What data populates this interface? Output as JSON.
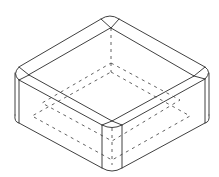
{
  "figure": {
    "type": "isometric line drawing",
    "description": "Isometric view of a square box with rounded vertical edges, showing visible edges as solid lines and hidden edges as dashed lines",
    "colors": {
      "background": "#ffffff",
      "line": "#2a2a2a"
    },
    "line_styles": [
      "solid (visible edges)",
      "dashed (hidden edges)"
    ]
  }
}
